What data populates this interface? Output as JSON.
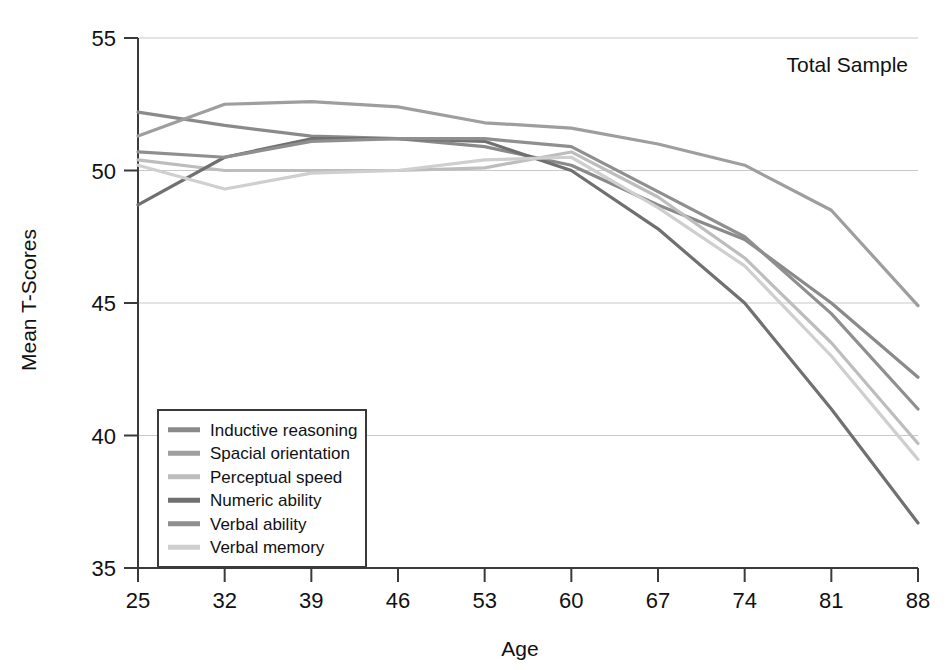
{
  "chart_data": {
    "type": "line",
    "title": "",
    "annotation": "Total Sample",
    "xlabel": "Age",
    "ylabel": "Mean T-Scores",
    "x": [
      25,
      32,
      39,
      46,
      53,
      60,
      67,
      74,
      81,
      88
    ],
    "categories": [
      "25",
      "32",
      "39",
      "46",
      "53",
      "60",
      "67",
      "74",
      "81",
      "88"
    ],
    "xlim": [
      25,
      88
    ],
    "ylim": [
      35,
      55
    ],
    "yticks": [
      35,
      40,
      45,
      50,
      55
    ],
    "xticks": [
      25,
      32,
      39,
      46,
      53,
      60,
      67,
      74,
      81,
      88
    ],
    "grid": "horizontal",
    "legend_position": "lower-left-inside",
    "series": [
      {
        "name": "Inductive reasoning",
        "color": "#8a8a8a",
        "values": [
          52.2,
          51.7,
          51.3,
          51.2,
          50.9,
          50.2,
          48.7,
          47.4,
          45.0,
          42.2
        ]
      },
      {
        "name": "Spacial orientation",
        "color": "#9e9e9e",
        "values": [
          51.3,
          52.5,
          52.6,
          52.4,
          51.8,
          51.6,
          51.0,
          50.2,
          48.5,
          44.9
        ]
      },
      {
        "name": "Perceptual speed",
        "color": "#bdbdbd",
        "values": [
          50.4,
          50.0,
          50.0,
          50.0,
          50.1,
          50.7,
          49.0,
          46.7,
          43.5,
          39.7
        ]
      },
      {
        "name": "Numeric ability",
        "color": "#707070",
        "values": [
          48.7,
          50.5,
          51.2,
          51.2,
          51.1,
          50.0,
          47.8,
          45.0,
          41.0,
          36.7
        ]
      },
      {
        "name": "Verbal ability",
        "color": "#8f8f8f",
        "values": [
          50.7,
          50.5,
          51.1,
          51.2,
          51.2,
          50.9,
          49.2,
          47.5,
          44.6,
          41.0
        ]
      },
      {
        "name": "Verbal memory",
        "color": "#cfcfcf",
        "values": [
          50.2,
          49.3,
          49.9,
          50.0,
          50.4,
          50.5,
          48.6,
          46.4,
          43.0,
          39.1
        ]
      }
    ]
  },
  "axes": {
    "y_title": "Mean T-Scores",
    "x_title": "Age",
    "y_tick_labels": [
      "55",
      "50",
      "45",
      "40",
      "35"
    ],
    "x_tick_labels": [
      "25",
      "32",
      "39",
      "46",
      "53",
      "60",
      "67",
      "74",
      "81",
      "88"
    ]
  },
  "annotation": {
    "total_sample": "Total Sample"
  },
  "legend": {
    "items": [
      {
        "label": "Inductive reasoning",
        "color": "#8a8a8a"
      },
      {
        "label": "Spacial orientation",
        "color": "#9e9e9e"
      },
      {
        "label": "Perceptual speed",
        "color": "#bdbdbd"
      },
      {
        "label": "Numeric ability",
        "color": "#707070"
      },
      {
        "label": "Verbal ability",
        "color": "#8f8f8f"
      },
      {
        "label": "Verbal memory",
        "color": "#cfcfcf"
      }
    ]
  },
  "colors": {
    "background": "#ffffff",
    "axis": "#3a3a3a",
    "grid": "#c9c9c9",
    "text": "#111111"
  }
}
